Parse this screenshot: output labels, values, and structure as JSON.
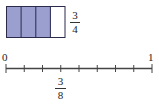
{
  "fraction_model": {
    "parts": 4,
    "shaded": 3,
    "shade_color": "#9a9fcf",
    "border_color": "#2a2a4a",
    "label": {
      "numerator": "3",
      "denominator": "4"
    }
  },
  "number_line": {
    "start_label": "0",
    "end_label": "1",
    "intervals": 8,
    "marked_tick": 3,
    "line_color": "#444444",
    "marked_label": {
      "numerator": "3",
      "denominator": "8"
    }
  }
}
